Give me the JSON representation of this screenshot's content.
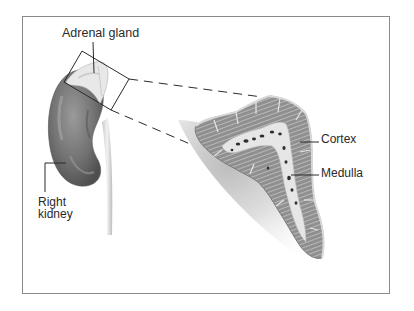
{
  "diagram": {
    "labels": {
      "adrenal_gland": "Adrenal gland",
      "cortex": "Cortex",
      "medulla": "Medulla",
      "right_kidney_line1": "Right",
      "right_kidney_line2": "kidney"
    },
    "colors": {
      "frame_border": "#8a8a8a",
      "kidney_fill": "#7a7a7a",
      "kidney_shadow": "#555555",
      "adrenal_fill": "#e6e6e6",
      "cortex_fill": "#8e8e8e",
      "medulla_fill": "#e4e4e4",
      "line_color": "#2a2a2a",
      "background": "#ffffff"
    }
  }
}
